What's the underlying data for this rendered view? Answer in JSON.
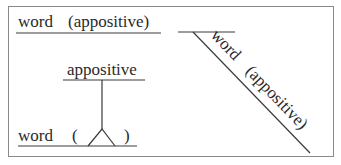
{
  "diagram": {
    "type": "sentence-diagram",
    "topic": "appositive diagramming",
    "colors": {
      "line": "#3a3a3a",
      "text": "#2a2a2a",
      "border": "#8a8a8a",
      "background": "#ffffff"
    },
    "examples": [
      {
        "id": "horizontal-inline",
        "word": "word",
        "appositive": "(appositive)"
      },
      {
        "id": "diagonal-modifier",
        "word": "word",
        "appositive": "(appositive)"
      },
      {
        "id": "pedestal",
        "appositive": "appositive",
        "word": "word",
        "open_paren": "(",
        "close_paren": ")"
      }
    ]
  }
}
